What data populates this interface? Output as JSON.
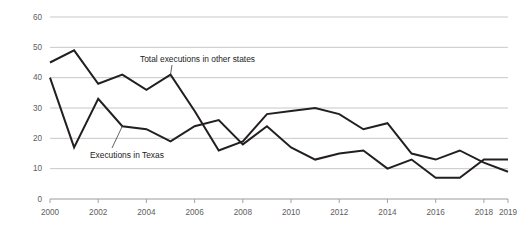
{
  "chart_data": {
    "type": "line",
    "title": "",
    "subtitle": "",
    "xlabel": "",
    "ylabel": "",
    "xlim": [
      2000,
      2019
    ],
    "ylim": [
      0,
      60
    ],
    "grid": true,
    "legend_position": "inline-annotations",
    "x": [
      2000,
      2001,
      2002,
      2003,
      2004,
      2005,
      2006,
      2007,
      2008,
      2009,
      2010,
      2011,
      2012,
      2013,
      2014,
      2015,
      2016,
      2017,
      2018,
      2019
    ],
    "y_ticks": [
      0,
      10,
      20,
      30,
      40,
      50,
      60
    ],
    "x_ticks": [
      2000,
      2002,
      2004,
      2006,
      2008,
      2010,
      2012,
      2014,
      2016,
      2018,
      2019
    ],
    "y_tick_labels": [
      "0",
      "10",
      "20",
      "30",
      "40",
      "50",
      "60"
    ],
    "x_tick_labels": [
      "2000",
      "2002",
      "2004",
      "2006",
      "2008",
      "2010",
      "2012",
      "2014",
      "2016",
      "2018",
      "2019"
    ],
    "series": [
      {
        "name": "Executions in Texas",
        "color": "#231f20",
        "values": [
          40,
          17,
          33,
          24,
          23,
          19,
          24,
          26,
          18,
          24,
          17,
          13,
          15,
          16,
          10,
          13,
          7,
          7,
          13,
          13
        ]
      },
      {
        "name": "Total executions in other states",
        "color": "#231f20",
        "values": [
          45,
          49,
          38,
          41,
          36,
          41,
          29,
          16,
          19,
          28,
          29,
          30,
          28,
          23,
          25,
          15,
          13,
          16,
          12,
          9
        ]
      }
    ],
    "annotations": [
      {
        "text": "Total executions in other states",
        "target_x": 2005,
        "target_y": 41,
        "label_x": 140,
        "label_y": 62
      },
      {
        "text": "Executions in Texas",
        "target_x": 2003,
        "target_y": 24,
        "label_x": 90,
        "label_y": 158
      }
    ]
  }
}
